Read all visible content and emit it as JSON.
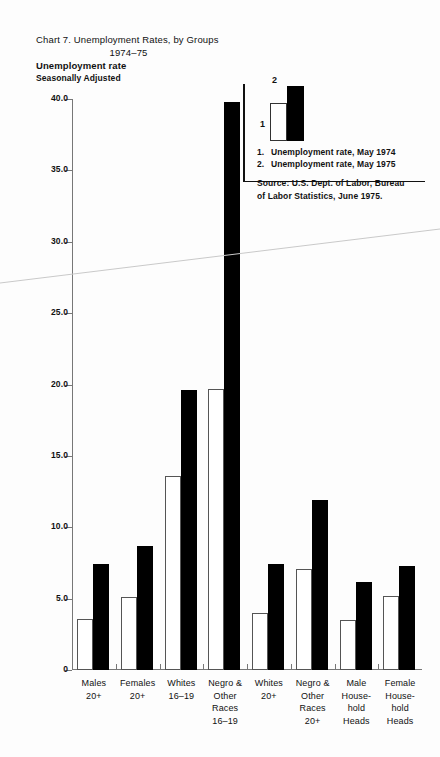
{
  "chart_data": {
    "type": "bar",
    "title": "Chart 7. Unemployment Rates, by Groups",
    "subtitle": "1974–75",
    "ylabel": "Unemployment rate",
    "note": "Seasonally Adjusted",
    "xlabel": "",
    "ylim": [
      0,
      40
    ],
    "ytick_labels": [
      "40.0",
      "35.0",
      "30.0",
      "25.0",
      "20.0",
      "15.0",
      "10.0",
      "5.0",
      "0"
    ],
    "ytick_values": [
      40,
      35,
      30,
      25,
      20,
      15,
      10,
      5,
      0
    ],
    "grid": false,
    "legend_position": "top-right",
    "categories": [
      "Males\n20+",
      "Females\n20+",
      "Whites\n16–19",
      "Negro &\nOther\nRaces\n16–19",
      "Whites\n20+",
      "Negro &\nOther\nRaces\n20+",
      "Male\nHouse-\nhold\nHeads",
      "Female\nHouse-\nhold\nHeads"
    ],
    "series": [
      {
        "name": "Unemployment rate, May 1974",
        "key": "1",
        "color": "#ffffff",
        "values": [
          3.6,
          5.1,
          13.6,
          19.7,
          4.0,
          7.1,
          3.5,
          5.2
        ]
      },
      {
        "name": "Unemployment rate, May 1975",
        "key": "2",
        "color": "#000000",
        "values": [
          7.4,
          8.7,
          19.6,
          39.8,
          7.4,
          11.9,
          6.2,
          7.3
        ]
      }
    ],
    "source": "Source:  U.S. Dept. of Labor, Bureau of Labor Statistics, June 1975."
  },
  "legend": {
    "entries": [
      {
        "num": "1.",
        "label": "Unemployment rate, May 1974"
      },
      {
        "num": "2.",
        "label": "Unemployment rate, May 1975"
      }
    ],
    "swatch_labels": {
      "first": "1",
      "second": "2"
    },
    "source_line_1": "Source:  U.S. Dept. of Labor, Bureau",
    "source_line_2": "of Labor Statistics, June 1975."
  },
  "categories_display": [
    [
      "Males",
      "20+"
    ],
    [
      "Females",
      "20+"
    ],
    [
      "Whites",
      "16–19"
    ],
    [
      "Negro &",
      "Other",
      "Races",
      "16–19"
    ],
    [
      "Whites",
      "20+"
    ],
    [
      "Negro &",
      "Other",
      "Races",
      "20+"
    ],
    [
      "Male",
      "House-",
      "hold",
      "Heads"
    ],
    [
      "Female",
      "House-",
      "hold",
      "Heads"
    ]
  ],
  "colors": {
    "bar_1974": "#ffffff",
    "bar_1975": "#000000",
    "axis": "#777777",
    "text": "#111111",
    "background": "#fdfdfd"
  }
}
